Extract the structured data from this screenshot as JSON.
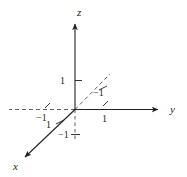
{
  "figure": {
    "kind": "3d-coordinate-axes-diagram",
    "background_color": "#ffffff",
    "stroke_color": "#231f20",
    "dashed_color": "#4d4d4d",
    "width": 187,
    "height": 177
  },
  "axes": [
    {
      "id": "z",
      "label": "z",
      "label_x": 77,
      "label_y": 7,
      "direction": "up"
    },
    {
      "id": "y",
      "label": "y",
      "label_x": 170,
      "label_y": 104,
      "direction": "right"
    },
    {
      "id": "x",
      "label": "x",
      "label_x": 13,
      "label_y": 161,
      "direction": "down-left"
    }
  ],
  "tick_labels": [
    {
      "id": "z-positive-one",
      "text": "1",
      "x": 60,
      "y": 76
    },
    {
      "id": "diagonal-minus-one",
      "text": "−1",
      "x": 93,
      "y": 88
    },
    {
      "id": "y-negative-one",
      "text": "−1",
      "x": 36,
      "y": 113
    },
    {
      "id": "y-positive-one",
      "text": "1",
      "x": 102,
      "y": 114
    },
    {
      "id": "x-positive-one",
      "text": "1",
      "x": 46,
      "y": 120
    },
    {
      "id": "z-negative-one",
      "text": "−1",
      "x": 58,
      "y": 130
    }
  ]
}
